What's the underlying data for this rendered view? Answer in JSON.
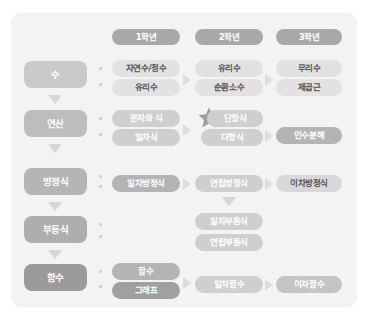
{
  "diagram": {
    "background_color": "#f3f3f3",
    "columns": [
      {
        "id": "grade1",
        "label": "1학년",
        "color": "#a8a8a8"
      },
      {
        "id": "grade2",
        "label": "2학년",
        "color": "#a8a8a8"
      },
      {
        "id": "grade3",
        "label": "3학년",
        "color": "#a8a8a8"
      }
    ],
    "rows": [
      {
        "id": "number",
        "label": "수",
        "label_color": "#c9c9c9",
        "grade1": [
          "자연수/정수",
          "유리수"
        ],
        "grade2": [
          "유리수",
          "순환소수"
        ],
        "grade3": [
          "무리수",
          "제곱근"
        ]
      },
      {
        "id": "operation",
        "label": "연산",
        "label_color": "#bdbdbd",
        "grade1": [
          "문자와 식",
          "일차식"
        ],
        "grade2": [
          "단항식",
          "다항식"
        ],
        "grade3": [
          "인수분해"
        ]
      },
      {
        "id": "equation",
        "label": "방정식",
        "label_color": "#b5b5b5",
        "grade1": [
          "일차방정식"
        ],
        "grade2": [
          "연립방정식"
        ],
        "grade3": [
          "이차방정식"
        ]
      },
      {
        "id": "inequality",
        "label": "부등식",
        "label_color": "#aeaeae",
        "grade1": [],
        "grade2": [
          "일차부등식",
          "연립부등식"
        ],
        "grade3": []
      },
      {
        "id": "function",
        "label": "함수",
        "label_color": "#9a9a9a",
        "grade1": [
          "함수",
          "그래프"
        ],
        "grade2": [
          "일차함수"
        ],
        "grade3": [
          "이차함수"
        ]
      }
    ],
    "pill_colors": {
      "light": "#e2e2e2",
      "mid": "#cfcfcf",
      "dark": "#a8a8a8",
      "darker": "#9a9a9a"
    },
    "marker": {
      "name": "star",
      "glyph": "★",
      "color": "#9e9e9e",
      "attached_to": "단항식"
    },
    "arrows": {
      "down_color": "#d6d6d6",
      "right_color": "#dcdcdc"
    }
  }
}
